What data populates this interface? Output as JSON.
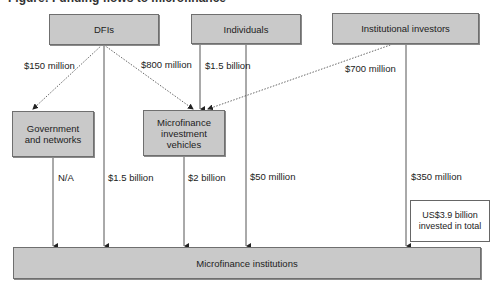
{
  "diagram": {
    "title_clipped": "Figure: Funding flows to microfinance",
    "sources": {
      "dfis": "DFIs",
      "individuals": "Individuals",
      "institutional": "Institutional investors"
    },
    "intermediaries": {
      "government": "Government and networks",
      "miv": "Microfinance investment vehicles"
    },
    "target": "Microfinance institutions",
    "flows": {
      "dfis_to_government": "$150 million",
      "dfis_to_miv": "$800 million",
      "individuals_to_miv": "$1.5 billion",
      "institutional_to_miv": "$700 million",
      "government_to_mfi": "N/A",
      "dfis_to_mfi": "$1.5 billion",
      "miv_to_mfi": "$2 billion",
      "individuals_to_mfi": "$50 million",
      "institutional_to_mfi": "$350 million"
    },
    "total_note": "US$3.9 billion invested in total",
    "colors": {
      "box_fill": "#c9c9c9",
      "box_border": "#6f6f6f",
      "line": "#444444"
    }
  }
}
